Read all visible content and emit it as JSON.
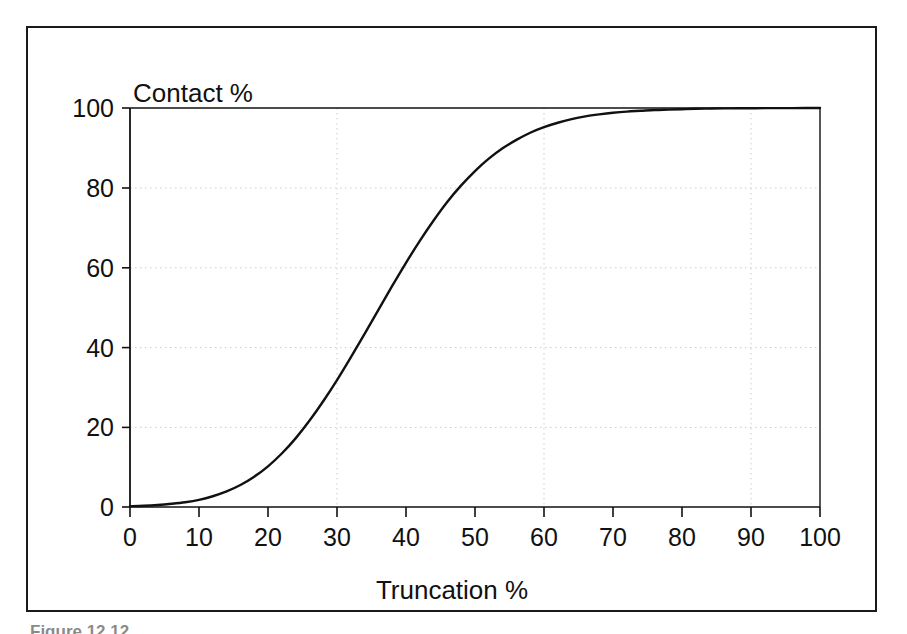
{
  "figure": {
    "caption": "Figure 12.12",
    "frame_color": "#1a1a1a",
    "background": "#ffffff"
  },
  "chart_data": {
    "type": "line",
    "title": "",
    "subtitle": "",
    "xlabel": "Truncation %",
    "ylabel": "Contact %",
    "xlim": [
      0,
      100
    ],
    "ylim": [
      0,
      100
    ],
    "grid": true,
    "grid_style": "dotted",
    "grid_color": "#cccccc",
    "legend": false,
    "legend_position": "none",
    "line_color": "#111111",
    "line_width": 2.4,
    "x_ticks": [
      0,
      10,
      20,
      30,
      40,
      50,
      60,
      70,
      80,
      90,
      100
    ],
    "y_ticks": [
      0,
      20,
      40,
      60,
      80,
      100
    ],
    "x_tick_labels": [
      "0",
      "10",
      "20",
      "30",
      "40",
      "50",
      "60",
      "70",
      "80",
      "90",
      "100"
    ],
    "y_tick_labels": [
      "0",
      "20",
      "40",
      "60",
      "80",
      "100"
    ],
    "series": [
      {
        "name": "Contact vs Truncation",
        "x": [
          0,
          2,
          4,
          6,
          8,
          10,
          12,
          14,
          16,
          18,
          20,
          22,
          24,
          26,
          28,
          30,
          32,
          34,
          36,
          38,
          40,
          42,
          44,
          46,
          48,
          50,
          52,
          54,
          56,
          58,
          60,
          62,
          64,
          66,
          68,
          70,
          72,
          74,
          76,
          78,
          80,
          82,
          84,
          86,
          88,
          90,
          92,
          94,
          96,
          98,
          100
        ],
        "values": [
          0.2,
          0.3,
          0.5,
          0.8,
          1.2,
          1.8,
          2.7,
          3.9,
          5.5,
          7.6,
          10.2,
          13.4,
          17.2,
          21.6,
          26.5,
          31.8,
          37.5,
          43.4,
          49.4,
          55.4,
          61.2,
          66.7,
          71.8,
          76.5,
          80.6,
          84.2,
          87.3,
          89.9,
          92.0,
          93.8,
          95.2,
          96.3,
          97.2,
          97.9,
          98.4,
          98.8,
          99.1,
          99.3,
          99.5,
          99.6,
          99.7,
          99.8,
          99.85,
          99.9,
          99.92,
          99.94,
          99.96,
          99.97,
          99.98,
          99.99,
          100
        ]
      }
    ],
    "annotations": []
  },
  "axes": {
    "y_title": "Contact %",
    "x_title": "Truncation %"
  }
}
